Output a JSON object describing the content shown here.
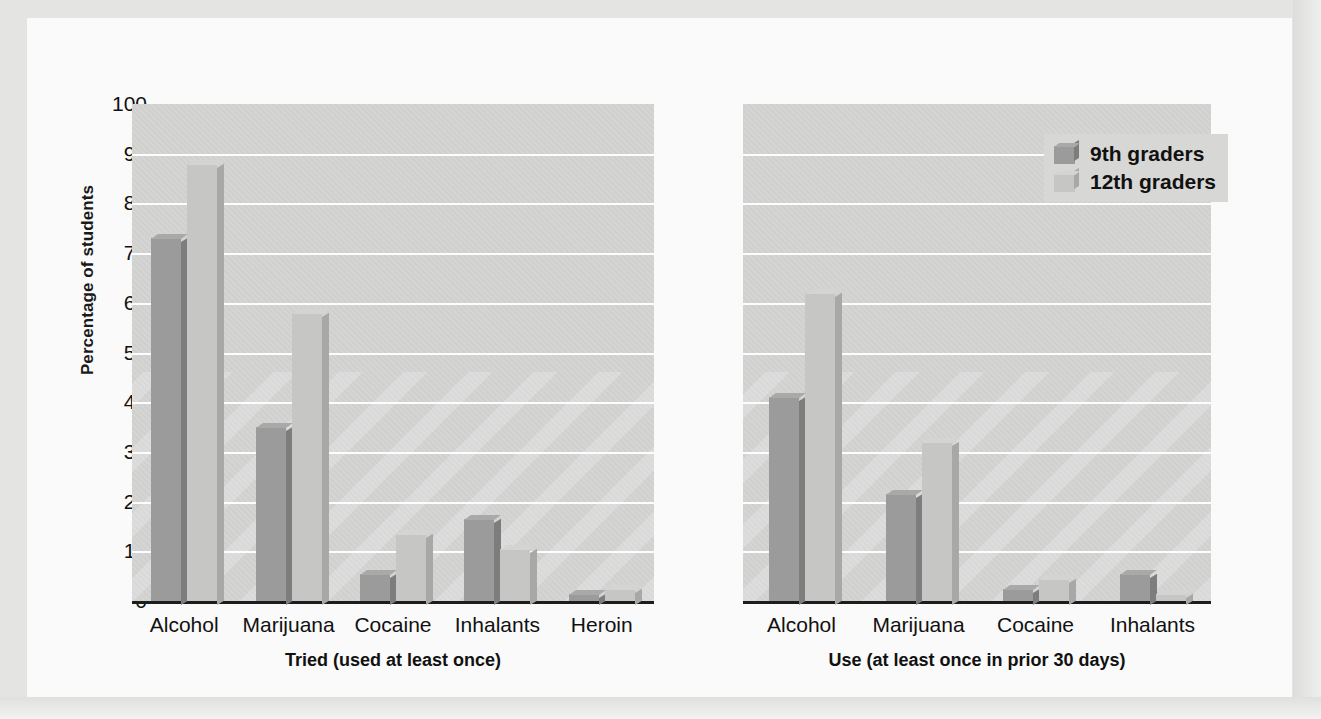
{
  "chart_data": {
    "type": "bar",
    "title": "",
    "ylabel": "Percentage of students",
    "xlabel": "",
    "ylim": [
      0,
      100
    ],
    "yticks": [
      100,
      90,
      80,
      70,
      60,
      50,
      40,
      30,
      20,
      10,
      0
    ],
    "grid": true,
    "legend_position": "top-right",
    "series_names": [
      "9th graders",
      "12th graders"
    ],
    "colors": {
      "series_9th": "#9b9b9b",
      "series_12th": "#c6c6c4",
      "plot_background": "#d0d0cf",
      "gridline": "#fdfdfd",
      "axis": "#1d1d1d",
      "figure_background": "#fafafa",
      "text": "#111111"
    },
    "panels": [
      {
        "title": "Tried (used at least once)",
        "categories": [
          "Alcohol",
          "Marijuana",
          "Cocaine",
          "Inhalants",
          "Heroin"
        ],
        "series": [
          {
            "name": "9th graders",
            "values": [
              73,
              35,
              5.5,
              16.5,
              1.5
            ]
          },
          {
            "name": "12th graders",
            "values": [
              88,
              58,
              13.5,
              10.5,
              2.5
            ]
          }
        ]
      },
      {
        "title": "Use (at least once in prior 30 days)",
        "categories": [
          "Alcohol",
          "Marijuana",
          "Cocaine",
          "Inhalants"
        ],
        "series": [
          {
            "name": "9th graders",
            "values": [
              41,
              21.5,
              2.5,
              5.5
            ]
          },
          {
            "name": "12th graders",
            "values": [
              62,
              32,
              4.5,
              1.5
            ]
          }
        ]
      }
    ]
  },
  "legend": {
    "items": [
      {
        "label": "9th graders"
      },
      {
        "label": "12th graders"
      }
    ]
  }
}
